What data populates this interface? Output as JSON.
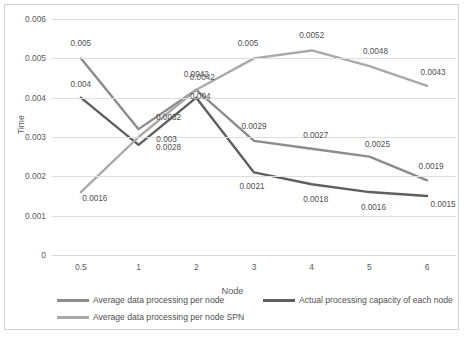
{
  "chart_data": {
    "type": "line",
    "title": "",
    "xlabel": "Node",
    "ylabel": "Time",
    "categories": [
      "0.5",
      "1",
      "2",
      "3",
      "4",
      "5",
      "6"
    ],
    "ylim": [
      0,
      0.006
    ],
    "yticks": [
      "0",
      "0.001",
      "0.002",
      "0.003",
      "0.004",
      "0.005",
      "0.006"
    ],
    "ytick_values": [
      0,
      0.001,
      0.002,
      0.003,
      0.004,
      0.005,
      0.006
    ],
    "grid": true,
    "legend_position": "bottom",
    "series": [
      {
        "name": "Average data processing per node",
        "color": "#8c8c8c",
        "values": [
          0.005,
          0.0032,
          0.0042,
          0.0029,
          0.0027,
          0.0025,
          0.0019
        ],
        "labels": [
          "0.005",
          "0.0032",
          "0.0042",
          "0.0029",
          "0.0027",
          "0.0025",
          "0.0019"
        ]
      },
      {
        "name": "Actual processing capacity of each node",
        "color": "#5f5f5f",
        "values": [
          0.004,
          0.0028,
          0.004,
          0.0021,
          0.0018,
          0.0016,
          0.0015
        ],
        "labels": [
          "0.004",
          "0.0028",
          "0.004",
          "0.0021",
          "0.0018",
          "0.0016",
          "0.0015"
        ]
      },
      {
        "name": "Average data processing per node SPN",
        "color": "#a9a9a9",
        "values": [
          0.0016,
          0.003,
          0.0042,
          0.005,
          0.0052,
          0.0048,
          0.0043
        ],
        "labels": [
          "0.0016",
          "0.003",
          "0.0042",
          "0.005",
          "0.0052",
          "0.0048",
          "0.0043"
        ]
      }
    ]
  },
  "caption": {
    "text": ""
  }
}
